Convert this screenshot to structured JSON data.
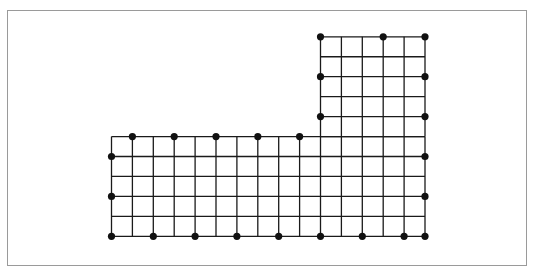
{
  "diagram": {
    "type": "L-shaped grid of points",
    "colors": {
      "line": "#1a1a1a",
      "dot": "#111111",
      "frame": "#9a9a9a"
    },
    "grid": {
      "x0": 111.5,
      "dx": 20.9,
      "y0": 36.8,
      "dy": 19.95,
      "lower_block": {
        "cols": [
          0,
          15
        ],
        "rows": [
          5,
          10
        ]
      },
      "upper_block": {
        "cols": [
          10,
          15
        ],
        "rows": [
          0,
          5
        ]
      }
    },
    "dots": [
      [
        10,
        0
      ],
      [
        13,
        0
      ],
      [
        15,
        0
      ],
      [
        10,
        2
      ],
      [
        15,
        2
      ],
      [
        10,
        4
      ],
      [
        15,
        4
      ],
      [
        1,
        5
      ],
      [
        3,
        5
      ],
      [
        5,
        5
      ],
      [
        7,
        5
      ],
      [
        9,
        5
      ],
      [
        0,
        6
      ],
      [
        15,
        6
      ],
      [
        0,
        8
      ],
      [
        15,
        8
      ],
      [
        0,
        10
      ],
      [
        2,
        10
      ],
      [
        4,
        10
      ],
      [
        6,
        10
      ],
      [
        8,
        10
      ],
      [
        10,
        10
      ],
      [
        12,
        10
      ],
      [
        14,
        10
      ],
      [
        15,
        10
      ]
    ]
  }
}
